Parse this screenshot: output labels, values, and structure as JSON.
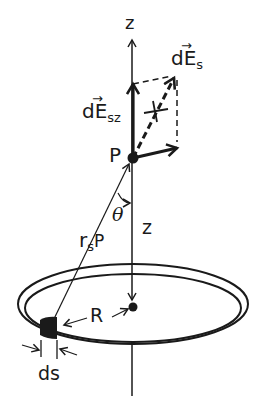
{
  "figure": {
    "colors": {
      "ink": "#1a1a1a",
      "background": "#ffffff"
    },
    "labels": {
      "z_axis": "z",
      "dEs_base": "dE",
      "dEs_sub": "s",
      "dEs_arrow": "→",
      "dEsz_base": "dE",
      "dEsz_sub": "sz",
      "dEsz_arrow": "→",
      "point": "P",
      "theta": "θ",
      "distance_z": "z",
      "rsP_base": "r",
      "rsP_sub": "s",
      "rsP_tail": "P",
      "radius": "R",
      "element": "ds"
    }
  }
}
